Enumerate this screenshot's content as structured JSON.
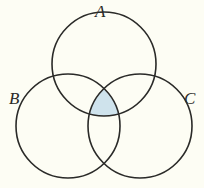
{
  "figure": {
    "type": "venn-diagram",
    "background_color": "#fdfdf4",
    "stroke_color": "#2a2a28",
    "stroke_width": 1.6,
    "shade_color": "#cfe3ec",
    "shade_stroke_color": "#9fc3d2",
    "width": 204,
    "height": 188,
    "labels": {
      "a": "A",
      "b": "B",
      "c": "C"
    },
    "sets": [
      {
        "id": "A",
        "label": "A",
        "cx": 104,
        "cy": 64,
        "r": 52,
        "label_position": "top"
      },
      {
        "id": "B",
        "label": "B",
        "cx": 68,
        "cy": 126,
        "r": 52,
        "label_position": "left"
      },
      {
        "id": "C",
        "label": "C",
        "cx": 140,
        "cy": 126,
        "r": 52,
        "label_position": "right"
      }
    ],
    "shaded_region": {
      "id": "A-and-B-and-C",
      "label": "A ∩ B ∩ C",
      "fill": "#cfe3ec",
      "vertices": [
        {
          "x": 104,
          "y": 75
        },
        {
          "x": 86,
          "y": 116
        },
        {
          "x": 122,
          "y": 116
        }
      ]
    }
  }
}
